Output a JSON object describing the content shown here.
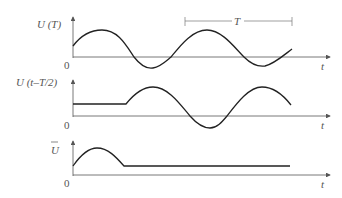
{
  "panels": [
    {
      "id": "top",
      "ylabel": "U  (T)",
      "origin": "0",
      "xlabel": "t",
      "period_marker": "T"
    },
    {
      "id": "middle",
      "ylabel": "U  (t–T/2)",
      "origin": "0",
      "xlabel": "t"
    },
    {
      "id": "bottom",
      "ylabel": "U",
      "ylabel_overbar": true,
      "origin": "0",
      "xlabel": "t"
    }
  ],
  "colors": {
    "curve": "#222222",
    "axis": "#555555",
    "text": "#555555"
  }
}
